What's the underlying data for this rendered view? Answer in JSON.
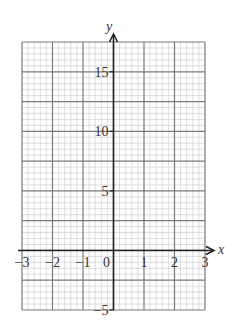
{
  "chart_data": {
    "type": "line",
    "title": "",
    "xlabel": "x",
    "ylabel": "y",
    "xlim": [
      -3,
      3
    ],
    "ylim": [
      -5,
      17.5
    ],
    "x_ticks": [
      -3,
      -2,
      -1,
      0,
      1,
      2,
      3
    ],
    "x_tick_labels": [
      "−3",
      "−2",
      "−1",
      "0",
      "1",
      "2",
      "3"
    ],
    "y_ticks": [
      -5,
      5,
      10,
      15
    ],
    "y_tick_labels": [
      "−5",
      "5",
      "10",
      "15"
    ],
    "grid": {
      "on": true,
      "x_major_step": 1,
      "x_minor_per_major": 5,
      "y_major_step": 2.5,
      "y_minor_per_major": 5
    },
    "series": [],
    "legend": null
  },
  "colors": {
    "minor_grid": "#c8c8c8",
    "major_grid": "#7a7a7a",
    "axis": "#222222",
    "text": "#333333"
  }
}
